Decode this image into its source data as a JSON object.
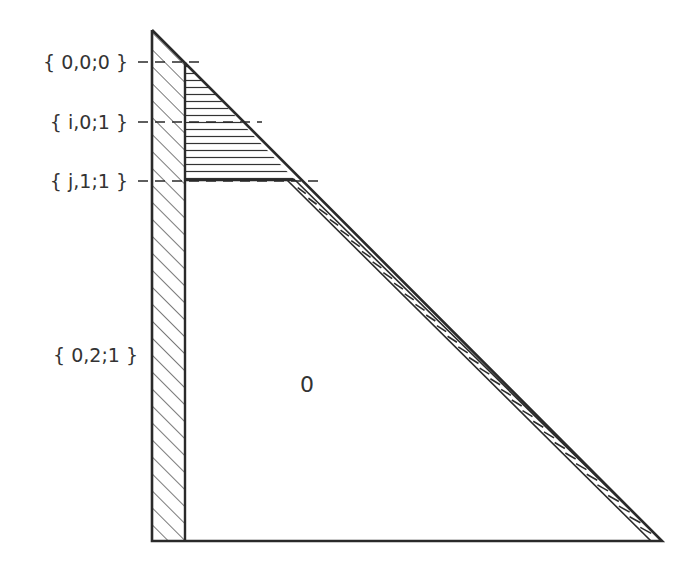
{
  "diagram": {
    "type": "triangle-region-partition",
    "stroke_color": "#2a2a2a",
    "background": "#ffffff",
    "level_labels": [
      {
        "text": "{ 0,0;0 }",
        "y": 62
      },
      {
        "text": "{ i,0;1 }",
        "y": 122
      },
      {
        "text": "{ j,1;1 }",
        "y": 181
      },
      {
        "text": "{ 0,2;1 }",
        "y": 355
      }
    ],
    "region_label": "0",
    "regions": [
      {
        "name": "left-strip",
        "pattern": "diagonal-hatch"
      },
      {
        "name": "top-wedge",
        "pattern": "horizontal-hatch"
      },
      {
        "name": "hypotenuse-band",
        "pattern": "ladder-hatch"
      },
      {
        "name": "interior",
        "pattern": "none",
        "label": "0"
      }
    ]
  }
}
